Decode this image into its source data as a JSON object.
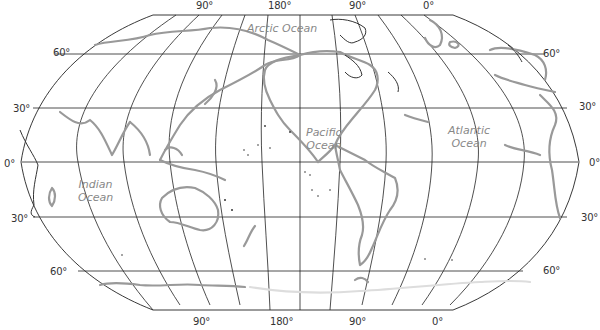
{
  "map": {
    "projection": "Robinson (Pacific-centered)",
    "oceans": [
      {
        "id": "arctic",
        "name": "Arctic Ocean",
        "lines": [
          "Arctic Ocean"
        ]
      },
      {
        "id": "pacific",
        "name": "Pacific Ocean",
        "lines": [
          "Pacific",
          "Ocean"
        ]
      },
      {
        "id": "atlantic",
        "name": "Atlantic Ocean",
        "lines": [
          "Atlantic",
          "Ocean"
        ]
      },
      {
        "id": "indian",
        "name": "Indian Ocean",
        "lines": [
          "Indian",
          "Ocean"
        ]
      }
    ],
    "longitude_labels_top": [
      "90°",
      "180°",
      "90°",
      "0°"
    ],
    "longitude_labels_bottom": [
      "90°",
      "180°",
      "90°",
      "0°"
    ],
    "latitude_labels_left": [
      "60°",
      "30°",
      "0°",
      "30°",
      "60°"
    ],
    "latitude_labels_right": [
      "60°",
      "30°",
      "0°",
      "30°",
      "60°"
    ],
    "colors": {
      "grid": "#222222",
      "coastline": "#999999",
      "ocean_label": "#888888",
      "background": "#ffffff"
    }
  }
}
